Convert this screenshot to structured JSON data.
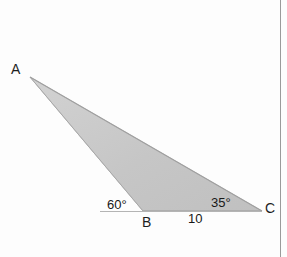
{
  "figure": {
    "kind": "geometry-diagram",
    "shape": "triangle",
    "background_color": "#fdfdfd",
    "fill_color": "#c8c8c8",
    "stroke_color": "#9e9e9e",
    "text_color": "#1d1d1d"
  },
  "vertices": {
    "A": {
      "label": "A",
      "x": 30,
      "y": 77
    },
    "B": {
      "label": "B",
      "x": 143,
      "y": 211
    },
    "C": {
      "label": "C",
      "x": 262,
      "y": 211
    }
  },
  "angles": {
    "at_B": {
      "label": "60°",
      "value": 60,
      "unit": "degrees"
    },
    "at_C": {
      "label": "35°",
      "value": 35,
      "unit": "degrees"
    }
  },
  "sides": {
    "BC": {
      "label": "10",
      "value": 10
    }
  },
  "baseline": {
    "x1": 100,
    "x2": 262,
    "y": 211,
    "color": "#b0b0b0"
  },
  "page_edge": {
    "name": "page-edge-line",
    "x": 280,
    "color": "#9a9a9a"
  }
}
